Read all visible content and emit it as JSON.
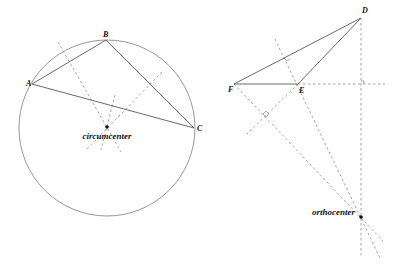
{
  "left_figure": {
    "vertices": {
      "A": {
        "label": "A",
        "x": 32,
        "y": 84
      },
      "B": {
        "label": "B",
        "x": 106,
        "y": 40
      },
      "C": {
        "label": "C",
        "x": 194,
        "y": 128
      }
    },
    "circle": {
      "cx": 107,
      "cy": 128,
      "r": 88
    },
    "center_label": "circumcenter",
    "center_point": {
      "x": 107,
      "y": 127
    }
  },
  "right_figure": {
    "vertices": {
      "D": {
        "label": "D",
        "x": 361,
        "y": 18
      },
      "E": {
        "label": "E",
        "x": 298,
        "y": 84
      },
      "F": {
        "label": "F",
        "x": 234,
        "y": 84
      }
    },
    "center_label": "orthocenter",
    "center_point": {
      "x": 361,
      "y": 217
    }
  }
}
